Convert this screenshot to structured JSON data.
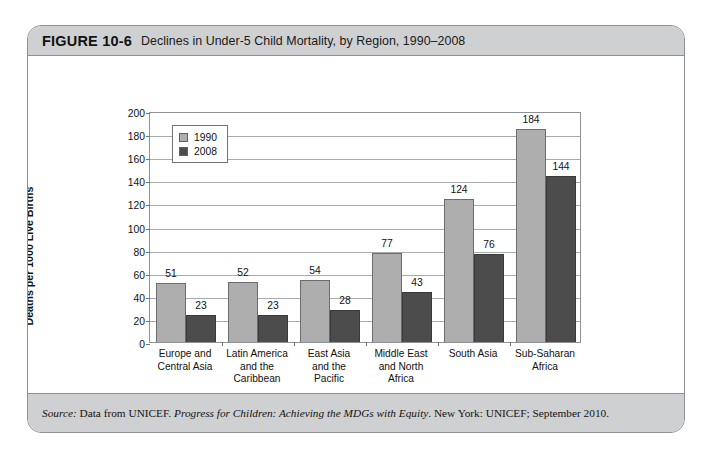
{
  "figure": {
    "number": "FIGURE 10-6",
    "title": "Declines in Under-5 Child Mortality, by Region, 1990–2008",
    "source_prefix": "Source:",
    "source_part1": " Data from UNICEF. ",
    "source_italic": "Progress for Children: Achieving the MDGs with Equity",
    "source_part2": ". New York: UNICEF; September 2010."
  },
  "chart_data": {
    "type": "bar",
    "title": "Declines in Under-5 Child Mortality, by Region, 1990–2008",
    "xlabel": "Region",
    "ylabel": "Deaths per 1000 Live Births",
    "ylim": [
      0,
      200
    ],
    "ytick_step": 20,
    "yticks": [
      0,
      20,
      40,
      60,
      80,
      100,
      120,
      140,
      160,
      180,
      200
    ],
    "grid": "horizontal",
    "legend_position": "top-left-inside",
    "categories": [
      "Europe and\nCentral Asia",
      "Latin America\nand the\nCaribbean",
      "East Asia\nand the\nPacific",
      "Middle East\nand North\nAfrica",
      "South Asia",
      "Sub-Saharan\nAfrica"
    ],
    "series": [
      {
        "name": "1990",
        "color": "#aeaeae",
        "values": [
          51,
          52,
          54,
          77,
          124,
          184
        ]
      },
      {
        "name": "2008",
        "color": "#4c4c4c",
        "values": [
          23,
          23,
          28,
          43,
          76,
          144
        ]
      }
    ]
  },
  "colors": {
    "band": "#cfd0d1",
    "border": "#8d9196",
    "series_1990": "#aeaeae",
    "series_2008": "#4c4c4c",
    "grid": "#a7abae"
  }
}
